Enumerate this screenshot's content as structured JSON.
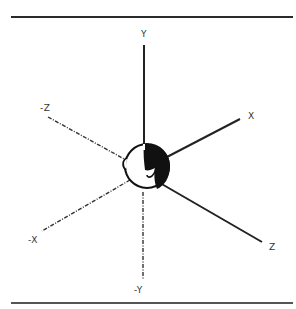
{
  "figure": {
    "type": "head-centered coordinate axes",
    "axes": {
      "y_pos": {
        "label": "Y",
        "style": "solid"
      },
      "y_neg": {
        "label": "-Y",
        "style": "dash-dot"
      },
      "x_pos": {
        "label": "X",
        "style": "solid"
      },
      "x_neg": {
        "label": "-X",
        "style": "dash-dot"
      },
      "z_pos": {
        "label": "Z",
        "style": "solid"
      },
      "z_neg": {
        "label": "-Z",
        "style": "dash-dot"
      }
    },
    "center_object": "human head (side profile)",
    "colors": {
      "line": "#222222",
      "hair": "#111111",
      "background": "#ffffff"
    }
  }
}
